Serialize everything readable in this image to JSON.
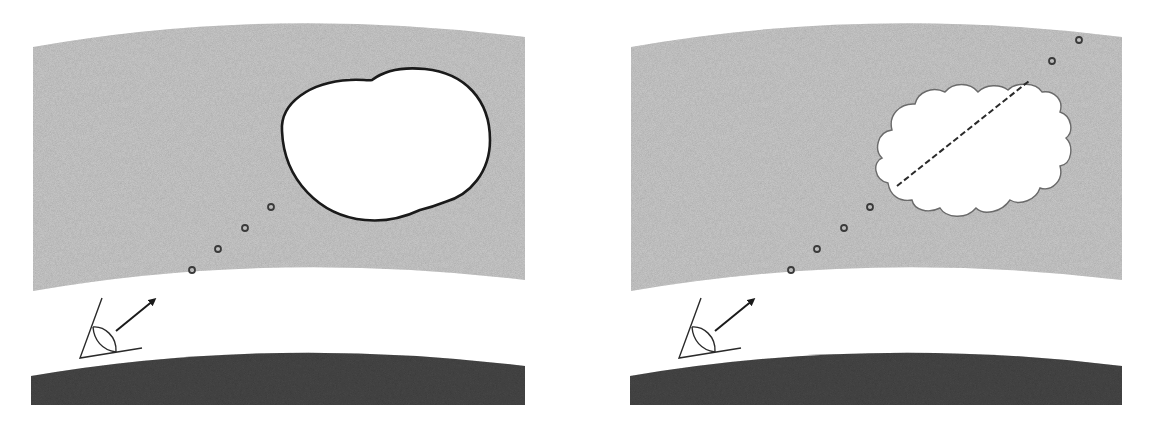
{
  "figure": {
    "width": 1150,
    "height": 429,
    "background": "#ffffff",
    "colors": {
      "atmosphere_layer": "#cdcdcd",
      "ground": "#4a4a4a",
      "outline": "#1a1a1a",
      "cloud_outline": "#6a6a6a",
      "cloud_fill": "#ffffff",
      "dot": "#3a3a3a"
    }
  },
  "panels": [
    {
      "id": "left",
      "description": "Observer viewing a smooth (bulging ellipse) cloud through an atmospheric layer",
      "cloud_shape": "smooth-ellipse",
      "line_of_sight_dots": [
        [
          192,
          270
        ],
        [
          218,
          249
        ],
        [
          245,
          228
        ],
        [
          271,
          207
        ]
      ],
      "has_dashed_line": false
    },
    {
      "id": "right",
      "description": "Observer viewing a billowy cumulus cloud; line of sight passes through cloud (dashed) and continues beyond",
      "cloud_shape": "cumulus",
      "line_of_sight_dots": [
        [
          791,
          270
        ],
        [
          817,
          249
        ],
        [
          844,
          228
        ],
        [
          870,
          207
        ],
        [
          1052,
          61
        ],
        [
          1079,
          40
        ]
      ],
      "has_dashed_line": true,
      "dashed_line": [
        [
          897,
          186
        ],
        [
          1029,
          81
        ]
      ]
    }
  ],
  "icons": {
    "observer": "eye-angle-icon",
    "direction": "arrow-up-right-icon"
  }
}
